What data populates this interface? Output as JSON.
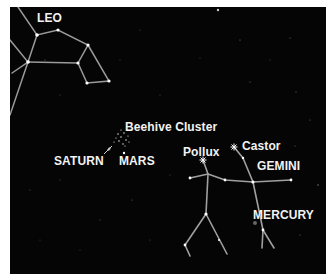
{
  "labels": {
    "leo": "LEO",
    "beehive": "Beehive Cluster",
    "saturn": "SATURN",
    "mars": "MARS",
    "pollux": "Pollux",
    "castor": "Castor",
    "gemini": "GEMINI",
    "mercury": "MERCURY"
  },
  "colors": {
    "sky": "#050505",
    "lines": "#9a9a9a",
    "stars": "#ffffff",
    "text": "#f2f2f2",
    "border": "#ffffff"
  }
}
